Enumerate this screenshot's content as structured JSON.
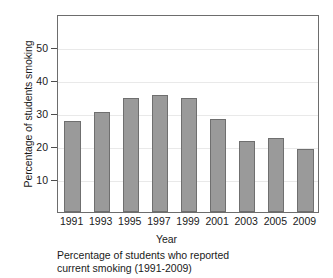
{
  "chart_data": {
    "type": "bar",
    "title": "",
    "caption_line1": "Percentage of students who reported",
    "caption_line2": "current smoking (1991-2009)",
    "xlabel": "Year",
    "ylabel": "Percentage of students smoking",
    "categories": [
      "1991",
      "1993",
      "1995",
      "1997",
      "1999",
      "2001",
      "2003",
      "2005",
      "2009"
    ],
    "values": [
      27.5,
      30.3,
      34.5,
      35.5,
      34.5,
      28.3,
      21.5,
      22.5,
      19.2
    ],
    "ylim": [
      0,
      60
    ],
    "yticks": [
      10,
      20,
      30,
      40,
      50
    ],
    "ytick_labels": [
      "10",
      "20",
      "30",
      "40",
      "50"
    ],
    "grid": true,
    "legend": "none",
    "bar_color": "#9a9a9a",
    "bar_edge_color": "#6f6f6f",
    "axis_color": "#6d6d6d",
    "grid_color": "#e9e9e9",
    "background": "#ffffff"
  }
}
